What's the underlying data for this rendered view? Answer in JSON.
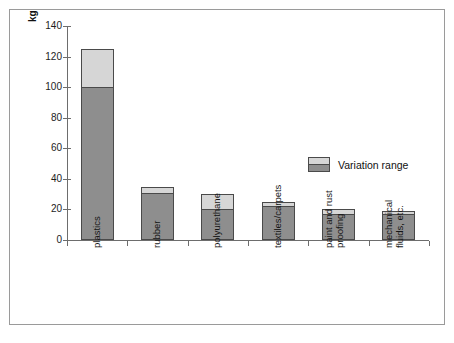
{
  "chart_data": {
    "type": "bar",
    "title": "",
    "subtitle": "",
    "xlabel": "",
    "ylabel": "kg",
    "ylim": [
      0,
      140
    ],
    "yticks": [
      0,
      20,
      40,
      60,
      80,
      100,
      120,
      140
    ],
    "grid": false,
    "legend_position": "center-right",
    "legend": [
      "Variation range"
    ],
    "categories": [
      "plastics",
      "rubber",
      "polyurethane",
      "textiles/carpets",
      "paint and rust proofing",
      "mechanical fluids, etc."
    ],
    "category_lines": [
      [
        "plastics"
      ],
      [
        "rubber"
      ],
      [
        "polyurethane"
      ],
      [
        "textiles/carpets"
      ],
      [
        "paint and rust",
        "proofing"
      ],
      [
        "mechanical",
        "fluids, etc."
      ]
    ],
    "series": [
      {
        "name": "low",
        "values": [
          100,
          31,
          20,
          22,
          17,
          17
        ]
      },
      {
        "name": "high",
        "values": [
          125,
          35,
          30,
          25,
          20,
          19
        ]
      }
    ]
  },
  "axis": {
    "unit_label": "kg",
    "tick_labels": [
      "140",
      "120",
      "100",
      "80",
      "60",
      "40",
      "20",
      "0"
    ]
  },
  "legend": {
    "label": "Variation range"
  },
  "colors": {
    "bar_low": "#8e8e8e",
    "bar_high": "#d6d6d6",
    "bar_outline": "#4a4a4a",
    "axis": "#6d6d6d",
    "frame": "#9a9a9a",
    "background": "#ffffff",
    "text": "#111111"
  }
}
